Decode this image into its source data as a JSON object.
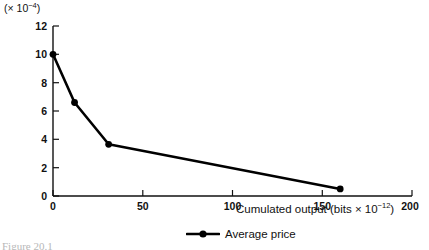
{
  "chart_data": {
    "type": "line",
    "title": "",
    "xlabel": "Cumulated output (bits × 10⁻¹²)",
    "ylabel": "(× 10⁻⁴)",
    "xlim": [
      0,
      200
    ],
    "ylim": [
      0,
      12
    ],
    "grid": false,
    "legend_position": "bottom-center",
    "xticks": [
      0,
      50,
      100,
      150,
      200
    ],
    "xtick_labels": [
      "0",
      "50",
      "100",
      "150",
      "200"
    ],
    "yticks": [
      0,
      2,
      4,
      6,
      8,
      10,
      12
    ],
    "ytick_labels": [
      "0",
      "2",
      "4",
      "6",
      "8",
      "10",
      "12"
    ],
    "series": [
      {
        "name": "Average price",
        "marker": "filled-circle",
        "color": "#000000",
        "x": [
          0,
          12,
          31,
          160
        ],
        "y": [
          10.0,
          6.6,
          3.65,
          0.5
        ]
      }
    ]
  },
  "axes": {
    "y_unit_prefix": "(× 10",
    "y_unit_exponent": "−4",
    "y_unit_suffix": ")",
    "x_title_prefix": "Cumulated output (bits × 10",
    "x_title_exponent": "−12",
    "x_title_suffix": ")"
  },
  "legend": {
    "items": [
      {
        "label": "Average price"
      }
    ]
  },
  "caption": {
    "text": "Figure 20.1"
  }
}
